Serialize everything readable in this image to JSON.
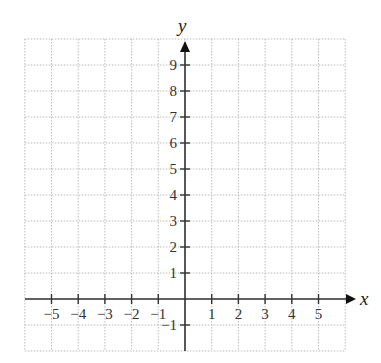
{
  "chart_data": {
    "type": "coordinate-grid",
    "title": "",
    "xlabel": "x",
    "ylabel": "y",
    "xlim": [
      -6,
      6
    ],
    "ylim": [
      -2,
      10
    ],
    "grid": true,
    "x_ticks": [
      "−5",
      "−4",
      "−3",
      "−2",
      "−1",
      "1",
      "2",
      "3",
      "4",
      "5"
    ],
    "y_ticks": [
      "9",
      "8",
      "7",
      "6",
      "5",
      "4",
      "3",
      "2",
      "1",
      "−1"
    ],
    "series": []
  },
  "axes": {
    "x_label": "x",
    "y_label": "y"
  }
}
